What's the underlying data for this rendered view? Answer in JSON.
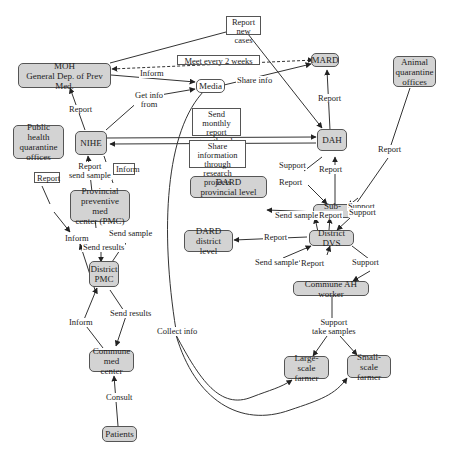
{
  "nodes": {
    "moh": "MOH\nGeneral Dep. of Prev Med.",
    "media": "Media",
    "mard": "MARD",
    "animal_quarantine": "Animal\nquarantine\noffices",
    "public_health_quarantine": "Public health\nquarantine\noffices",
    "nihe": "NIHE",
    "dah": "DAH",
    "dard_provincial": "DARD\nprovincial level",
    "sub_dah": "Sub-DAH",
    "pmc": "Provincial\npreventive med\ncenter (PMC)",
    "dard_district": "DARD\ndistrict level",
    "district_dvs": "District DVS",
    "district_pmc": "District\nPMC",
    "commune_ah_worker": "Commune AH worker",
    "commune_med_center": "Commune\nmed center",
    "large_scale_farmer": "Large-scale\nfarmer",
    "small_scale_farmer": "Small-scale\nfarmer",
    "patients": "Patients"
  },
  "boxed_labels": {
    "report_new_cases": "Report\nnew cases",
    "meet_every_2_weeks": "Meet every 2 weeks",
    "send_monthly_report": "Send monthly\nreport\n+ outbreak",
    "share_info_research": "Share information\nthrough\nresearch projects",
    "report_phq": "Report",
    "inform_nihe_pmc": "Inform"
  },
  "edge_labels": {
    "inform_moh_media": "Inform",
    "get_info_from": "Get info\nfrom",
    "share_info": "Share info",
    "report_nihe_moh": "Report",
    "report_dah_mard": "Report",
    "report_animal_quarantine": "Report",
    "report_send_sample_pmc_nihe": "Report\nsend sample",
    "support_dah_subdah": "Support",
    "report_subdah_dah": "Report",
    "report_subdah_dard": "Report",
    "support_subdah_right": "Support",
    "send_sample_dvs_subdah": "Send sample",
    "report_dvs_subdah": "Report",
    "support_subdah_dvs": "Support",
    "report_dvs_dard": "Report",
    "send_sample_ah_dvs": "Send sample",
    "report_ah_dvs": "Report",
    "support_dvs_ah": "Support",
    "inform_pmc_dpmc": "Inform",
    "send_results_pmc_dpmc": "Send results",
    "send_sample_dpmc_pmc": "Send sample",
    "inform_cmc_dpmc": "Inform",
    "send_results_dpmc_cmc": "Send results",
    "collect_info": "Collect info",
    "support_take_samples": "Support\ntake samples",
    "consult": "Consult"
  },
  "colors": {
    "node_fill": "#d3d3d3",
    "node_border": "#555555",
    "edge": "#333333",
    "background": "#ffffff"
  }
}
